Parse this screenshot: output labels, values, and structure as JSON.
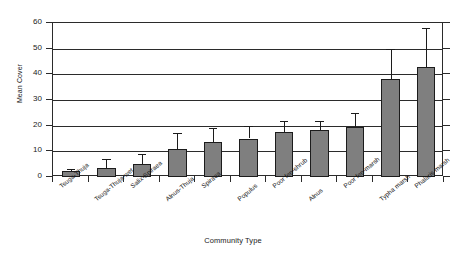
{
  "chart_data": {
    "type": "bar",
    "title": "",
    "xlabel": "Community Type",
    "ylabel": "Mean Cover",
    "ylim": [
      0,
      60
    ],
    "yticks": [
      0,
      10,
      20,
      30,
      40,
      50,
      60
    ],
    "grid": "horizontal",
    "legend": "none",
    "error_bars": "upper only",
    "bar_color": "#7f7f7f",
    "bar_edge_color": "#1c1c1c",
    "categories": [
      "Tsuga-Thuja",
      "Tsuga-Thuja-wet",
      "Salix-Spiraea",
      "Alnus-Thuja",
      "Spiraea",
      "Populus",
      "Poor fen-shrub",
      "Alnus",
      "Poor fen-marsh",
      "Typha marsh",
      "Phalaris marsh"
    ],
    "values": [
      2.5,
      3.5,
      5.0,
      11.0,
      13.5,
      15.0,
      17.5,
      18.5,
      19.5,
      38.0,
      43.0
    ],
    "error_upper": [
      3.2,
      7.0,
      9.0,
      17.0,
      19.0,
      20.0,
      22.0,
      22.0,
      25.0,
      50.0,
      58.0
    ]
  }
}
